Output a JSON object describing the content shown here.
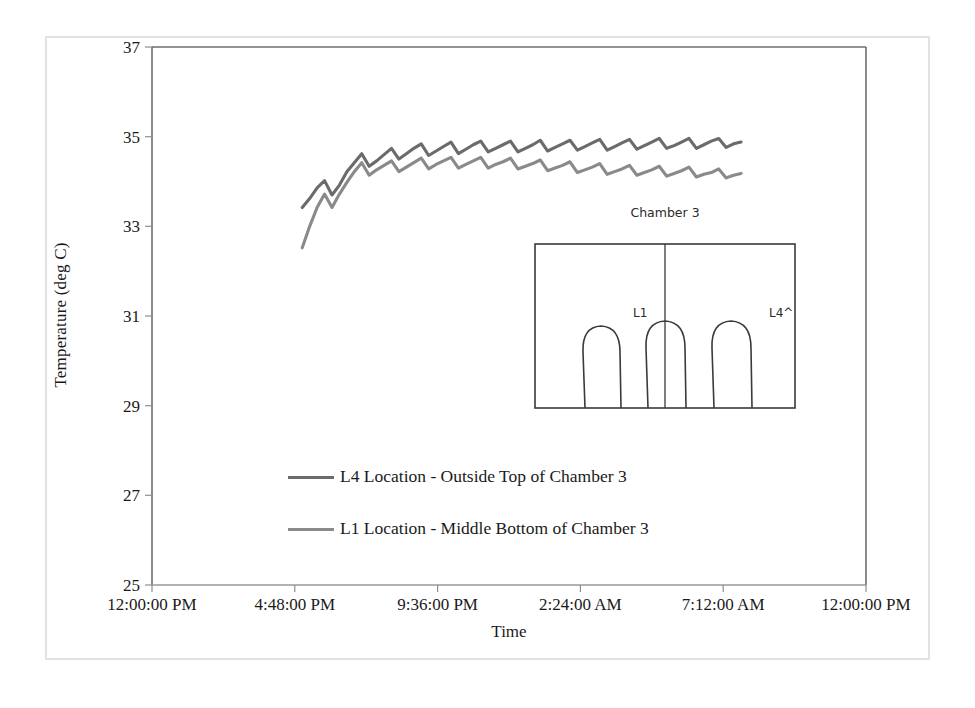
{
  "chart_data": {
    "type": "line",
    "title": "",
    "xlabel": "Time",
    "ylabel": "Temperature (deg C)",
    "ylim": [
      25,
      37
    ],
    "yticks": [
      25,
      27,
      29,
      31,
      33,
      35,
      37
    ],
    "xticks": [
      "12:00:00 PM",
      "4:48:00 PM",
      "9:36:00 PM",
      "2:24:00 AM",
      "7:12:00 AM",
      "12:00:00 PM"
    ],
    "grid": false,
    "legend_position": "inside-lower-left",
    "series": [
      {
        "name": "L4 Location - Outside Top of Chamber 3",
        "color": "#6b6b6b",
        "x": [
          5.05,
          5.3,
          5.55,
          5.8,
          6.05,
          6.3,
          6.55,
          6.8,
          7.05,
          7.3,
          7.55,
          7.8,
          8.05,
          8.3,
          8.55,
          8.8,
          9.05,
          9.3,
          9.55,
          9.8,
          10.05,
          10.3,
          10.55,
          10.8,
          11.05,
          11.3,
          11.55,
          11.8,
          12.05,
          12.3,
          12.55,
          12.8,
          13.05,
          13.3,
          13.55,
          13.8,
          14.05,
          14.3,
          14.55,
          14.8,
          15.05,
          15.3,
          15.55,
          15.8,
          16.05,
          16.3,
          16.55,
          16.8,
          17.05,
          17.3,
          17.55,
          17.8,
          18.05,
          18.3,
          18.55,
          18.8,
          19.05,
          19.3,
          19.55,
          19.8
        ],
        "y": [
          33.42,
          33.62,
          33.86,
          34.02,
          33.7,
          33.92,
          34.22,
          34.42,
          34.62,
          34.34,
          34.46,
          34.6,
          34.74,
          34.5,
          34.62,
          34.74,
          34.84,
          34.58,
          34.68,
          34.78,
          34.88,
          34.62,
          34.72,
          34.82,
          34.9,
          34.66,
          34.74,
          34.82,
          34.9,
          34.66,
          34.74,
          34.82,
          34.92,
          34.68,
          34.76,
          34.84,
          34.92,
          34.7,
          34.78,
          34.86,
          34.94,
          34.7,
          34.78,
          34.86,
          34.94,
          34.72,
          34.8,
          34.88,
          34.96,
          34.74,
          34.8,
          34.88,
          34.96,
          34.74,
          34.82,
          34.9,
          34.96,
          34.76,
          34.84,
          34.88
        ]
      },
      {
        "name": "L1 Location - Middle Bottom of Chamber 3",
        "color": "#8a8a8a",
        "x": [
          5.05,
          5.3,
          5.55,
          5.8,
          6.05,
          6.3,
          6.55,
          6.8,
          7.05,
          7.3,
          7.55,
          7.8,
          8.05,
          8.3,
          8.55,
          8.8,
          9.05,
          9.3,
          9.55,
          9.8,
          10.05,
          10.3,
          10.55,
          10.8,
          11.05,
          11.3,
          11.55,
          11.8,
          12.05,
          12.3,
          12.55,
          12.8,
          13.05,
          13.3,
          13.55,
          13.8,
          14.05,
          14.3,
          14.55,
          14.8,
          15.05,
          15.3,
          15.55,
          15.8,
          16.05,
          16.3,
          16.55,
          16.8,
          17.05,
          17.3,
          17.55,
          17.8,
          18.05,
          18.3,
          18.55,
          18.8,
          19.05,
          19.3,
          19.55,
          19.8
        ],
        "y": [
          32.52,
          33.0,
          33.42,
          33.72,
          33.42,
          33.72,
          33.98,
          34.22,
          34.42,
          34.14,
          34.26,
          34.36,
          34.46,
          34.22,
          34.32,
          34.42,
          34.52,
          34.28,
          34.38,
          34.46,
          34.54,
          34.3,
          34.38,
          34.46,
          34.54,
          34.3,
          34.38,
          34.44,
          34.52,
          34.28,
          34.34,
          34.4,
          34.48,
          34.24,
          34.3,
          34.36,
          34.44,
          34.2,
          34.26,
          34.32,
          34.4,
          34.16,
          34.22,
          34.28,
          34.36,
          34.14,
          34.2,
          34.26,
          34.34,
          34.12,
          34.18,
          34.24,
          34.32,
          34.1,
          34.16,
          34.2,
          34.28,
          34.08,
          34.14,
          34.18
        ]
      }
    ]
  },
  "axis": {
    "y_title": "Temperature (deg C)",
    "x_title": "Time",
    "y_tick_labels": [
      "37",
      "35",
      "33",
      "31",
      "29",
      "27",
      "25"
    ],
    "x_tick_labels": [
      "12:00:00 PM",
      "4:48:00 PM",
      "9:36:00 PM",
      "2:24:00 AM",
      "7:12:00 AM",
      "12:00:00 PM"
    ]
  },
  "legend": {
    "items": [
      {
        "label": "L4 Location - Outside Top of Chamber 3",
        "color": "#6b6b6b"
      },
      {
        "label": "L1 Location - Middle Bottom of Chamber 3",
        "color": "#8a8a8a"
      }
    ]
  },
  "inset": {
    "title": "Chamber 3",
    "marker_l1": "L1",
    "marker_l4": "L4^"
  }
}
